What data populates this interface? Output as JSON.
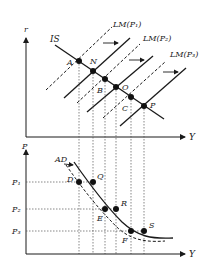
{
  "colors": {
    "ink": "#1a1a1a",
    "guide": "#555555",
    "background": "#ffffff"
  },
  "top_panel": {
    "y_axis_label": "r",
    "x_axis_label": "Y",
    "is_label": "IS",
    "lm_labels": [
      "LM(P₁)",
      "LM(P₂)",
      "LM(P₃)"
    ],
    "points": [
      {
        "id": "A",
        "label": "A"
      },
      {
        "id": "N",
        "label": "N"
      },
      {
        "id": "B",
        "label": "B"
      },
      {
        "id": "O",
        "label": "O"
      },
      {
        "id": "C",
        "label": "C"
      },
      {
        "id": "P",
        "label": "P"
      }
    ]
  },
  "bottom_panel": {
    "y_axis_label": "P",
    "x_axis_label": "Y",
    "ad_label": "AD",
    "price_levels": [
      "P₁",
      "P₂",
      "P₃"
    ],
    "points": [
      {
        "id": "D",
        "label": "D"
      },
      {
        "id": "Q",
        "label": "Q"
      },
      {
        "id": "E",
        "label": "E"
      },
      {
        "id": "R",
        "label": "R"
      },
      {
        "id": "F",
        "label": "F"
      },
      {
        "id": "S",
        "label": "S"
      }
    ]
  }
}
